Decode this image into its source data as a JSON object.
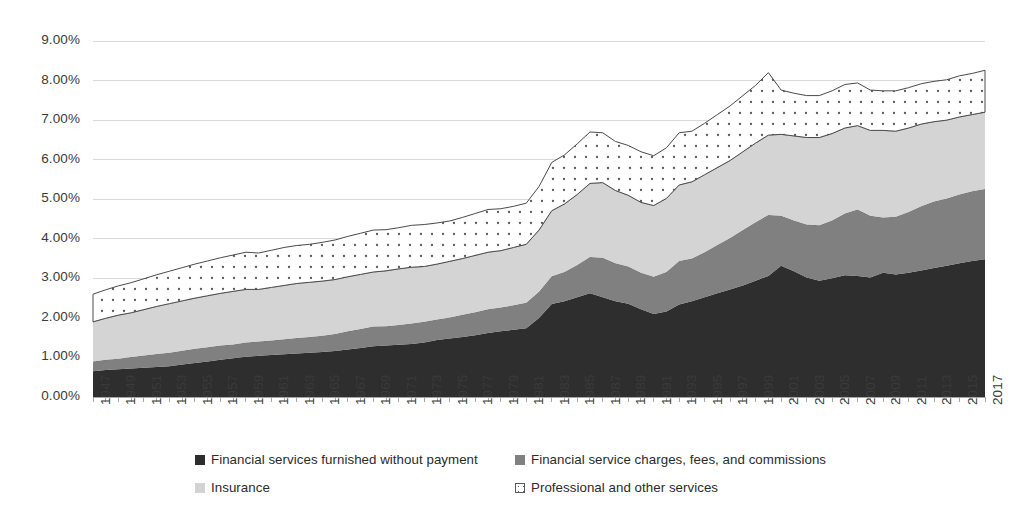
{
  "chart_data": {
    "type": "area",
    "stacked": true,
    "title": "",
    "subtitle": "",
    "xlabel": "",
    "ylabel": "",
    "grid": true,
    "legend_position": "bottom",
    "ylim": [
      0,
      9
    ],
    "ytick_labels": [
      "0.00%",
      "1.00%",
      "2.00%",
      "3.00%",
      "4.00%",
      "5.00%",
      "6.00%",
      "7.00%",
      "8.00%",
      "9.00%"
    ],
    "ytick_values": [
      0,
      1,
      2,
      3,
      4,
      5,
      6,
      7,
      8,
      9
    ],
    "value_unit": "percent",
    "xlim": [
      1947,
      2017
    ],
    "xtick_labels": [
      "1947",
      "1949",
      "1951",
      "1953",
      "1955",
      "1957",
      "1959",
      "1961",
      "1963",
      "1965",
      "1967",
      "1969",
      "1971",
      "1973",
      "1975",
      "1977",
      "1979",
      "1981",
      "1983",
      "1985",
      "1987",
      "1989",
      "1991",
      "1993",
      "1995",
      "1997",
      "1999",
      "2001",
      "2003",
      "2005",
      "2007",
      "2009",
      "2011",
      "2013",
      "2015",
      "2017"
    ],
    "x": [
      1947,
      1948,
      1949,
      1950,
      1951,
      1952,
      1953,
      1954,
      1955,
      1956,
      1957,
      1958,
      1959,
      1960,
      1961,
      1962,
      1963,
      1964,
      1965,
      1966,
      1967,
      1968,
      1969,
      1970,
      1971,
      1972,
      1973,
      1974,
      1975,
      1976,
      1977,
      1978,
      1979,
      1980,
      1981,
      1982,
      1983,
      1984,
      1985,
      1986,
      1987,
      1988,
      1989,
      1990,
      1991,
      1992,
      1993,
      1994,
      1995,
      1996,
      1997,
      1998,
      1999,
      2000,
      2001,
      2002,
      2003,
      2004,
      2005,
      2006,
      2007,
      2008,
      2009,
      2010,
      2011,
      2012,
      2013,
      2014,
      2015,
      2016,
      2017
    ],
    "series": [
      {
        "name": "Financial services furnished without payment",
        "color": "#2e2e2e",
        "pattern": "solid",
        "values": [
          0.65,
          0.68,
          0.7,
          0.72,
          0.74,
          0.76,
          0.78,
          0.82,
          0.86,
          0.9,
          0.94,
          0.98,
          1.02,
          1.04,
          1.06,
          1.08,
          1.1,
          1.12,
          1.14,
          1.16,
          1.2,
          1.24,
          1.28,
          1.3,
          1.32,
          1.34,
          1.38,
          1.44,
          1.48,
          1.52,
          1.56,
          1.62,
          1.66,
          1.7,
          1.74,
          2.0,
          2.35,
          2.42,
          2.52,
          2.62,
          2.52,
          2.42,
          2.36,
          2.22,
          2.1,
          2.16,
          2.34,
          2.42,
          2.52,
          2.62,
          2.72,
          2.82,
          2.94,
          3.06,
          3.32,
          3.18,
          3.02,
          2.94,
          3.0,
          3.08,
          3.06,
          3.02,
          3.14,
          3.1,
          3.14,
          3.2,
          3.26,
          3.32,
          3.38,
          3.44,
          3.48
        ]
      },
      {
        "name": "Financial service charges, fees, and commissions",
        "color": "#808080",
        "pattern": "solid",
        "values": [
          0.25,
          0.26,
          0.27,
          0.29,
          0.31,
          0.33,
          0.34,
          0.35,
          0.36,
          0.36,
          0.36,
          0.35,
          0.36,
          0.36,
          0.37,
          0.38,
          0.39,
          0.4,
          0.41,
          0.43,
          0.46,
          0.48,
          0.5,
          0.49,
          0.5,
          0.52,
          0.52,
          0.52,
          0.53,
          0.56,
          0.58,
          0.6,
          0.6,
          0.62,
          0.64,
          0.66,
          0.7,
          0.74,
          0.82,
          0.92,
          1.0,
          0.96,
          0.94,
          0.92,
          0.94,
          1.0,
          1.1,
          1.08,
          1.14,
          1.22,
          1.3,
          1.4,
          1.48,
          1.54,
          1.26,
          1.28,
          1.34,
          1.4,
          1.46,
          1.56,
          1.68,
          1.56,
          1.4,
          1.46,
          1.54,
          1.62,
          1.68,
          1.7,
          1.74,
          1.76,
          1.78
        ]
      },
      {
        "name": "Insurance",
        "color": "#d4d4d4",
        "pattern": "solid",
        "values": [
          1.0,
          1.05,
          1.1,
          1.12,
          1.16,
          1.2,
          1.24,
          1.26,
          1.28,
          1.3,
          1.32,
          1.34,
          1.34,
          1.32,
          1.34,
          1.36,
          1.38,
          1.38,
          1.38,
          1.38,
          1.38,
          1.38,
          1.38,
          1.4,
          1.42,
          1.42,
          1.4,
          1.4,
          1.42,
          1.42,
          1.44,
          1.44,
          1.44,
          1.46,
          1.48,
          1.56,
          1.66,
          1.72,
          1.78,
          1.86,
          1.9,
          1.84,
          1.8,
          1.78,
          1.8,
          1.86,
          1.92,
          1.94,
          1.96,
          1.96,
          1.96,
          1.98,
          2.0,
          2.02,
          2.06,
          2.14,
          2.2,
          2.22,
          2.2,
          2.16,
          2.12,
          2.16,
          2.2,
          2.16,
          2.12,
          2.08,
          2.02,
          1.98,
          1.96,
          1.94,
          1.94
        ]
      },
      {
        "name": "Professional and other services",
        "color": "#ffffff",
        "pattern": "dots",
        "values": [
          0.7,
          0.72,
          0.74,
          0.76,
          0.78,
          0.8,
          0.82,
          0.84,
          0.86,
          0.88,
          0.9,
          0.92,
          0.94,
          0.92,
          0.94,
          0.96,
          0.96,
          0.96,
          0.98,
          1.0,
          1.02,
          1.04,
          1.06,
          1.04,
          1.04,
          1.06,
          1.06,
          1.04,
          1.02,
          1.04,
          1.06,
          1.08,
          1.06,
          1.04,
          1.04,
          1.1,
          1.22,
          1.24,
          1.28,
          1.3,
          1.26,
          1.24,
          1.26,
          1.28,
          1.26,
          1.28,
          1.32,
          1.28,
          1.3,
          1.34,
          1.38,
          1.42,
          1.46,
          1.58,
          1.12,
          1.08,
          1.06,
          1.06,
          1.08,
          1.1,
          1.08,
          1.02,
          1.0,
          1.02,
          1.02,
          1.02,
          1.02,
          1.02,
          1.04,
          1.04,
          1.06
        ]
      }
    ]
  },
  "legend": {
    "entries": [
      {
        "label": "Financial services furnished without payment",
        "swatch": "#2e2e2e",
        "pattern": "solid"
      },
      {
        "label": "Financial service charges, fees, and commissions",
        "swatch": "#808080",
        "pattern": "solid"
      },
      {
        "label": "Insurance",
        "swatch": "#d4d4d4",
        "pattern": "solid"
      },
      {
        "label": "Professional and other services",
        "swatch": "#ffffff",
        "pattern": "dots"
      }
    ]
  },
  "axes": {
    "gridline_color": "#d9d9d9",
    "axis_line_color": "#a6a6a6",
    "tick_text_color": "#3a3a3a"
  }
}
